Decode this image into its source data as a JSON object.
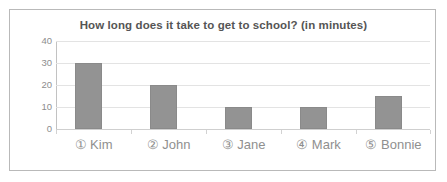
{
  "chart_data": {
    "type": "bar",
    "title": "How long does it take to get to school? (in minutes)",
    "xlabel": "",
    "ylabel": "",
    "categories": [
      "① Kim",
      "② John",
      "③ Jane",
      "④ Mark",
      "⑤ Bonnie"
    ],
    "category_names": [
      "Kim",
      "John",
      "Jane",
      "Mark",
      "Bonnie"
    ],
    "category_markers": [
      "①",
      "②",
      "③",
      "④",
      "⑤"
    ],
    "values": [
      30,
      20,
      10,
      10,
      15
    ],
    "ylim": [
      0,
      40
    ],
    "yticks": [
      0,
      10,
      20,
      30,
      40
    ],
    "ytick_labels": [
      "0",
      "10",
      "20",
      "30",
      "40"
    ],
    "grid": true,
    "legend": "none",
    "bar_color": "#939393",
    "grid_color": "#e3e3e3",
    "axis_color": "#c2c2c2",
    "title_color": "#555555",
    "tick_label_color": "#8d8d8d",
    "category_label_color": "#8f8f8f",
    "frame_border_color": "#b9b9b9",
    "background_color": "#ffffff"
  }
}
